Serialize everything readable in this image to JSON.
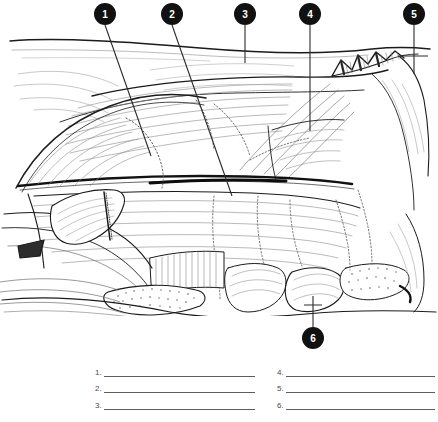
{
  "worksheet": {
    "title": "Unlabeled anatomical muscle illustration with numbered callouts",
    "background_color": "#ffffff",
    "ink_color": "#1a1a1a",
    "callout_fill": "#111111",
    "callout_text_color": "#ffffff",
    "rule_color": "#5d5d5d"
  },
  "callouts": [
    {
      "id": "callout-1",
      "label": "1",
      "cx": 105,
      "cy": 14,
      "r": 11,
      "leader": {
        "x1": 105,
        "y1": 25,
        "x2": 151,
        "y2": 156
      }
    },
    {
      "id": "callout-2",
      "label": "2",
      "cx": 172,
      "cy": 14,
      "r": 11,
      "leader": {
        "x1": 172,
        "y1": 25,
        "x2": 232,
        "y2": 196
      }
    },
    {
      "id": "callout-3",
      "label": "3",
      "cx": 245,
      "cy": 14,
      "r": 11,
      "leader": {
        "x1": 245,
        "y1": 25,
        "x2": 245,
        "y2": 63
      }
    },
    {
      "id": "callout-4",
      "label": "4",
      "cx": 310,
      "cy": 14,
      "r": 11,
      "leader": {
        "x1": 310,
        "y1": 25,
        "x2": 310,
        "y2": 131
      }
    },
    {
      "id": "callout-5",
      "label": "5",
      "cx": 414,
      "cy": 14,
      "r": 11,
      "leader": {
        "x1": 414,
        "y1": 25,
        "x2": 414,
        "y2": 74
      }
    },
    {
      "id": "callout-6",
      "label": "6",
      "cx": 313,
      "cy": 338,
      "r": 11,
      "leader": {
        "x1": 313,
        "y1": 327,
        "x2": 313,
        "y2": 296
      }
    }
  ],
  "answers": {
    "left_column": [
      {
        "number": "1."
      },
      {
        "number": "2."
      },
      {
        "number": "3."
      }
    ],
    "right_column": [
      {
        "number": "4."
      },
      {
        "number": "5."
      },
      {
        "number": "6."
      }
    ]
  }
}
